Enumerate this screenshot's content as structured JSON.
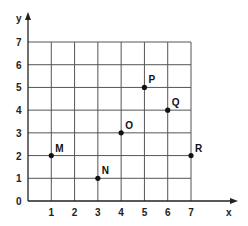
{
  "chart_data": {
    "type": "scatter",
    "title": "",
    "xlabel": "x",
    "ylabel": "y",
    "xlim": [
      0,
      7
    ],
    "ylim": [
      0,
      7
    ],
    "grid": true,
    "x_ticks": [
      "1",
      "2",
      "3",
      "4",
      "5",
      "6",
      "7"
    ],
    "y_ticks": [
      "1",
      "2",
      "3",
      "4",
      "5",
      "6",
      "7"
    ],
    "origin_label": "0",
    "points": [
      {
        "label": "M",
        "x": 1,
        "y": 2
      },
      {
        "label": "N",
        "x": 3,
        "y": 1
      },
      {
        "label": "O",
        "x": 4,
        "y": 3
      },
      {
        "label": "P",
        "x": 5,
        "y": 5
      },
      {
        "label": "Q",
        "x": 6,
        "y": 4
      },
      {
        "label": "R",
        "x": 7,
        "y": 2
      }
    ]
  },
  "colors": {
    "grid": "#555555",
    "axis": "#222222",
    "point": "#111111"
  }
}
